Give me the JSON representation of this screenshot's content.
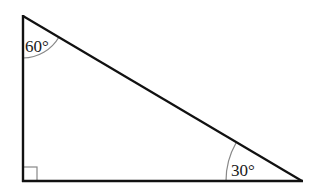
{
  "diagram": {
    "type": "right-triangle",
    "vertices": {
      "top": {
        "x": 23,
        "y": 16
      },
      "bottom_left": {
        "x": 23,
        "y": 181
      },
      "bottom_right": {
        "x": 302,
        "y": 181
      }
    },
    "angles": {
      "top": {
        "label": "60°",
        "value": 60
      },
      "bottom_right": {
        "label": "30°",
        "value": 30
      },
      "bottom_left": {
        "label": "",
        "value": 90,
        "marker": "right-angle-square"
      }
    },
    "colors": {
      "stroke": "#111111",
      "arc": "#777777",
      "background": "#ffffff"
    }
  }
}
